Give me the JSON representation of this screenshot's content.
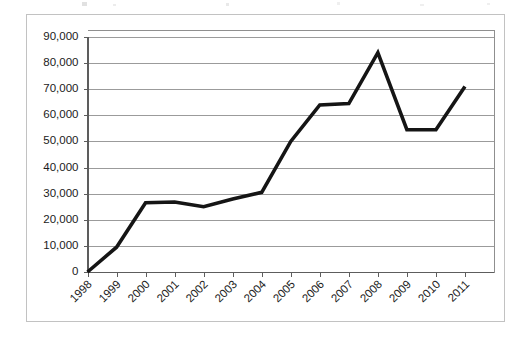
{
  "figure": {
    "background_color": "#ffffff",
    "frame_color": "#c2c2c2",
    "gridline_color": "#9b9b9b",
    "line_color": "#151515"
  },
  "chart_data": {
    "type": "line",
    "title": "",
    "subtitle": "",
    "xlabel": "",
    "ylabel": "",
    "categories": [
      "1998",
      "1999",
      "2000",
      "2001",
      "2002",
      "2003",
      "2004",
      "2005",
      "2006",
      "2007",
      "2008",
      "2009",
      "2010",
      "2011"
    ],
    "values": [
      0,
      9500,
      26500,
      26800,
      25000,
      28000,
      30500,
      50000,
      64000,
      64500,
      84000,
      54500,
      54500,
      71000
    ],
    "series": [
      {
        "name": "",
        "values": [
          0,
          9500,
          26500,
          26800,
          25000,
          28000,
          30500,
          50000,
          64000,
          64500,
          84000,
          54500,
          54500,
          71000
        ]
      }
    ],
    "ylim": [
      0,
      90000
    ],
    "ytick_values": [
      0,
      10000,
      20000,
      30000,
      40000,
      50000,
      60000,
      70000,
      80000,
      90000
    ],
    "ytick_labels": [
      "0",
      "10,000",
      "20,000",
      "30,000",
      "40,000",
      "50,000",
      "60,000",
      "70,000",
      "80,000",
      "90,000"
    ],
    "xtick_labels": [
      "1998",
      "1999",
      "2000",
      "2001",
      "2002",
      "2003",
      "2004",
      "2005",
      "2006",
      "2007",
      "2008",
      "2009",
      "2010",
      "2011"
    ],
    "xtick_rotation_degrees": 45,
    "grid": true,
    "grid_axis": "y",
    "legend": false,
    "legend_position": "none",
    "markers": false,
    "annotations": []
  }
}
